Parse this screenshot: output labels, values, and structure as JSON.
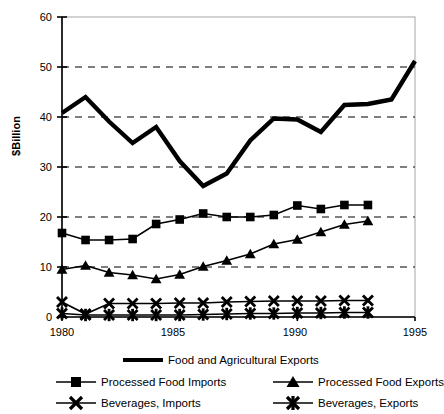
{
  "chart_data": {
    "type": "line",
    "title": "",
    "xlabel": "",
    "ylabel": "$Billion",
    "xlim": [
      1980,
      1995
    ],
    "ylim": [
      0,
      60
    ],
    "xticks": [
      1980,
      1985,
      1990,
      1995
    ],
    "yticks": [
      0,
      10,
      20,
      30,
      40,
      50,
      60
    ],
    "grid": "horizontal dashed gridlines at 10,20,30,40,50",
    "legend_position": "below-plot",
    "series": [
      {
        "name": "Food and Agricultural Exports",
        "marker": "none",
        "style": "thick-solid",
        "x": [
          1980,
          1981,
          1982,
          1983,
          1984,
          1985,
          1986,
          1987,
          1988,
          1989,
          1990,
          1991,
          1992,
          1993,
          1994,
          1995
        ],
        "values": [
          40.8,
          44.0,
          39.1,
          34.8,
          38.0,
          31.2,
          26.2,
          28.7,
          35.3,
          39.7,
          39.5,
          37.0,
          42.4,
          42.6,
          43.5,
          51.2
        ]
      },
      {
        "name": "Processed Food Imports",
        "marker": "square",
        "style": "thin-solid",
        "x": [
          1980,
          1981,
          1982,
          1983,
          1984,
          1985,
          1986,
          1987,
          1988,
          1989,
          1990,
          1991,
          1992,
          1993
        ],
        "values": [
          16.8,
          15.4,
          15.4,
          15.6,
          18.6,
          19.5,
          20.7,
          20.0,
          20.0,
          20.4,
          22.3,
          21.6,
          22.4,
          22.4
        ]
      },
      {
        "name": "Processed Food Exports",
        "marker": "triangle",
        "style": "thin-solid",
        "x": [
          1980,
          1981,
          1982,
          1983,
          1984,
          1985,
          1986,
          1987,
          1988,
          1989,
          1990,
          1991,
          1992,
          1993
        ],
        "values": [
          9.5,
          10.3,
          8.9,
          8.4,
          7.6,
          8.5,
          10.1,
          11.3,
          12.6,
          14.6,
          15.5,
          17.0,
          18.5,
          19.2
        ]
      },
      {
        "name": "Beverages, Imports",
        "marker": "x",
        "style": "thin-solid",
        "x": [
          1980,
          1981,
          1982,
          1983,
          1984,
          1985,
          1986,
          1987,
          1988,
          1989,
          1990,
          1991,
          1992,
          1993
        ],
        "values": [
          3.0,
          0.6,
          2.7,
          2.7,
          2.7,
          2.8,
          2.8,
          3.0,
          3.1,
          3.2,
          3.2,
          3.2,
          3.3,
          3.3
        ]
      },
      {
        "name": "Beverages, Exports",
        "marker": "star",
        "style": "thin-solid",
        "x": [
          1980,
          1981,
          1982,
          1983,
          1984,
          1985,
          1986,
          1987,
          1988,
          1989,
          1990,
          1991,
          1992,
          1993
        ],
        "values": [
          0.7,
          0.4,
          0.4,
          0.4,
          0.4,
          0.4,
          0.5,
          0.6,
          0.7,
          0.7,
          0.8,
          0.8,
          0.9,
          0.9
        ]
      }
    ]
  },
  "axis": {
    "ylabel": "$Billion",
    "yticks": [
      "0",
      "10",
      "20",
      "30",
      "40",
      "50",
      "60"
    ],
    "xticks": [
      "1980",
      "1985",
      "1990",
      "1995"
    ]
  },
  "legend": {
    "items": [
      {
        "label": "Food and Agricultural Exports",
        "marker": "none"
      },
      {
        "label": "Processed Food Imports",
        "marker": "square"
      },
      {
        "label": "Processed Food Exports",
        "marker": "triangle"
      },
      {
        "label": "Beverages, Imports",
        "marker": "x"
      },
      {
        "label": "Beverages, Exports",
        "marker": "star"
      }
    ]
  },
  "colors": {
    "line": "#000000",
    "grid": "#555555",
    "frame": "#b4b4b4",
    "background": "#ffffff"
  }
}
